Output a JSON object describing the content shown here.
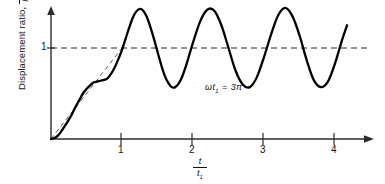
{
  "figure": {
    "background_color": "#ffffff",
    "curve_color": "#000000",
    "axis_color": "#2b2b2b",
    "dashed_color": "#555555"
  },
  "axes": {
    "y_label_prefix": "Displacement ratio,",
    "y_label_fraction_numerator": "u",
    "y_label_fraction_denominator_main": "P",
    "y_label_fraction_denominator_sub": "o",
    "y_label_fraction_denominator_tail": "/k",
    "y_tick_label": "1",
    "x_label_numerator": "t",
    "x_label_denominator_main": "t",
    "x_label_denominator_sub": "1",
    "x_tick_labels": [
      "1",
      "2",
      "3",
      "4"
    ]
  },
  "annotation": {
    "symbol": "ωt",
    "subscript": "1",
    "equals": "=",
    "value": "3π",
    "full_text": "ωt₁ = 3π"
  },
  "chart_data": {
    "type": "line",
    "title": "",
    "subtitle": "",
    "xlabel": "t / t₁",
    "ylabel": "Displacement ratio, u / (P₀/k)",
    "xlim": [
      0,
      4.5
    ],
    "ylim": [
      0,
      1.55
    ],
    "grid": false,
    "legend_position": "none",
    "x_ticks": [
      1,
      2,
      3,
      4
    ],
    "y_ticks": [
      1
    ],
    "annotations": [
      {
        "text": "ωt₁ = 3π",
        "x": 2.45,
        "y": 0.57
      }
    ],
    "reference_lines": [
      {
        "orientation": "horizontal",
        "value": 1,
        "style": "dashed",
        "label": "1",
        "x_start": 0,
        "x_end": 4.5
      }
    ],
    "series": [
      {
        "name": "Linearly increasing force (ramp input)",
        "style": "dashed",
        "color": "#555555",
        "x": [
          0,
          1
        ],
        "y": [
          0,
          1
        ]
      },
      {
        "name": "Dynamic response",
        "style": "solid",
        "color": "#000000",
        "description": "Ramp response with superimposed oscillation; rises with ripples to t/t1 = 1 then oscillates steadily about 1 with amplitude about 0.44 and period about 0.667 in t/t1",
        "steady_mean": 1.0,
        "steady_amplitude": 0.44,
        "steady_period": 0.667,
        "ramp_ripple_amplitude": 0.1,
        "x_start": 0,
        "x_end": 4.17,
        "x": [
          0.0,
          0.05,
          0.1,
          0.15,
          0.2,
          0.25,
          0.3,
          0.35,
          0.4,
          0.45,
          0.5,
          0.55,
          0.6,
          0.65,
          0.7,
          0.75,
          0.8,
          0.85,
          0.9,
          0.95,
          1.0,
          1.05,
          1.1,
          1.15,
          1.2,
          1.25,
          1.3,
          1.35,
          1.4,
          1.45,
          1.5,
          1.55,
          1.6,
          1.65,
          1.7,
          1.75,
          1.8,
          1.85,
          1.9,
          1.95,
          2.0,
          2.1,
          2.2,
          2.3,
          2.4,
          2.5,
          2.6,
          2.7,
          2.8,
          2.9,
          3.0,
          3.1,
          3.2,
          3.3,
          3.4,
          3.5,
          3.6,
          3.7,
          3.8,
          3.9,
          4.0,
          4.1,
          4.17
        ],
        "y": [
          0.0,
          0.01,
          0.04,
          0.09,
          0.15,
          0.21,
          0.28,
          0.36,
          0.43,
          0.5,
          0.55,
          0.59,
          0.62,
          0.63,
          0.64,
          0.65,
          0.67,
          0.72,
          0.79,
          0.88,
          0.98,
          1.1,
          1.22,
          1.33,
          1.4,
          1.43,
          1.41,
          1.34,
          1.23,
          1.1,
          0.96,
          0.82,
          0.7,
          0.62,
          0.57,
          0.57,
          0.61,
          0.69,
          0.8,
          0.93,
          1.06,
          1.29,
          1.42,
          1.41,
          1.25,
          1.0,
          0.75,
          0.6,
          0.57,
          0.68,
          0.9,
          1.15,
          1.36,
          1.44,
          1.35,
          1.14,
          0.87,
          0.65,
          0.57,
          0.63,
          0.83,
          1.09,
          1.25
        ]
      }
    ]
  }
}
